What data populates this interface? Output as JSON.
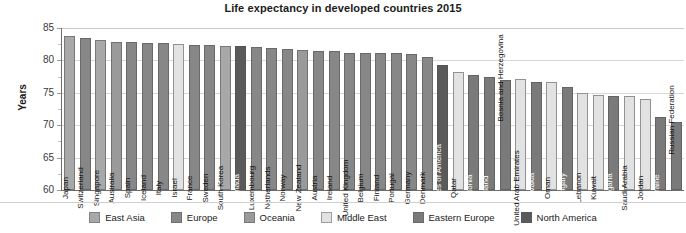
{
  "chart_data": {
    "type": "bar",
    "title": "Life expectancy in developed countries 2015",
    "xlabel": "",
    "ylabel": "Years",
    "ylim": [
      60,
      85
    ],
    "yticks": [
      60,
      65,
      70,
      75,
      80,
      85
    ],
    "grid": true,
    "legend_position": "bottom",
    "categories": [
      "Japan",
      "Switzerland",
      "Singapore",
      "Australia",
      "Spain",
      "Iceland",
      "Italy",
      "Israel",
      "France",
      "Sweden",
      "South Korea",
      "Canada",
      "Luxembourg",
      "Netherlands",
      "Norway",
      "New Zealand",
      "Austria",
      "Ireland",
      "United Kingdom",
      "Belgium",
      "Finland",
      "Portugal",
      "Germany",
      "Denmark",
      "United States of America",
      "Qatar",
      "Estonia",
      "Poland",
      "Bosnia and Herzegovina",
      "United Arab Emirates",
      "Slovakia",
      "Oman",
      "Hungary",
      "Lebanon",
      "Kuwait",
      "Bulgaria",
      "Saudi Arabia",
      "Jordan",
      "Ukraine",
      "Russian Federation"
    ],
    "values": [
      83.7,
      83.4,
      83.1,
      82.8,
      82.8,
      82.7,
      82.7,
      82.5,
      82.4,
      82.4,
      82.3,
      82.2,
      82.0,
      81.9,
      81.8,
      81.6,
      81.5,
      81.4,
      81.2,
      81.1,
      81.1,
      81.1,
      81.0,
      80.6,
      79.3,
      78.2,
      77.8,
      77.5,
      77.0,
      77.1,
      76.7,
      76.6,
      75.9,
      74.9,
      74.7,
      74.5,
      74.5,
      74.1,
      71.3,
      70.5
    ],
    "series_groups": [
      "East Asia",
      "Europe",
      "East Asia",
      "Oceania",
      "Europe",
      "Europe",
      "Europe",
      "Middle East",
      "Europe",
      "Europe",
      "East Asia",
      "North America",
      "Europe",
      "Europe",
      "Europe",
      "Oceania",
      "Europe",
      "Europe",
      "Europe",
      "Europe",
      "Europe",
      "Europe",
      "Europe",
      "Europe",
      "North America",
      "Middle East",
      "Eastern Europe",
      "Eastern Europe",
      "Eastern Europe",
      "Middle East",
      "Eastern Europe",
      "Middle East",
      "Eastern Europe",
      "Middle East",
      "Middle East",
      "Eastern Europe",
      "Middle East",
      "Middle East",
      "Eastern Europe",
      "Eastern Europe"
    ],
    "legend": [
      {
        "label": "East Asia",
        "color": "#a8a8a8"
      },
      {
        "label": "Europe",
        "color": "#878787"
      },
      {
        "label": "Oceania",
        "color": "#9a9a9a"
      },
      {
        "label": "Middle East",
        "color": "#e2e2e2"
      },
      {
        "label": "Eastern Europe",
        "color": "#7a7a7a"
      },
      {
        "label": "North America",
        "color": "#5a5a5a"
      }
    ]
  }
}
